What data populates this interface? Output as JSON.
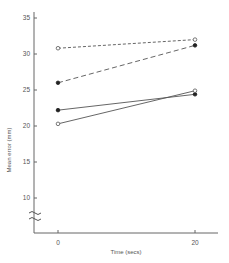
{
  "chart_data": {
    "type": "line",
    "title": "",
    "xlabel": "Time (secs)",
    "ylabel": "Mean error (mm)",
    "x": [
      0,
      20
    ],
    "x_ticks": [
      "0",
      "20"
    ],
    "y_ticks": [
      "10",
      "15",
      "20",
      "25",
      "30",
      "35"
    ],
    "ylim": [
      5,
      36
    ],
    "y_axis_break": true,
    "grid": false,
    "legend": null,
    "series": [
      {
        "name": "open circles, short-dashed",
        "marker": "open-circle",
        "line": "dotted-dash",
        "values": [
          30.8,
          32.0
        ]
      },
      {
        "name": "filled circles, long-dashed",
        "marker": "filled-circle",
        "line": "dashed",
        "values": [
          26.0,
          31.2
        ]
      },
      {
        "name": "filled circles, solid",
        "marker": "filled-circle",
        "line": "solid",
        "values": [
          22.2,
          24.4
        ]
      },
      {
        "name": "open circles, solid",
        "marker": "open-circle",
        "line": "solid",
        "values": [
          20.3,
          24.9
        ]
      }
    ],
    "colors": {
      "axis": "#666666",
      "line": "#555555",
      "marker_fill": "#222222"
    }
  }
}
